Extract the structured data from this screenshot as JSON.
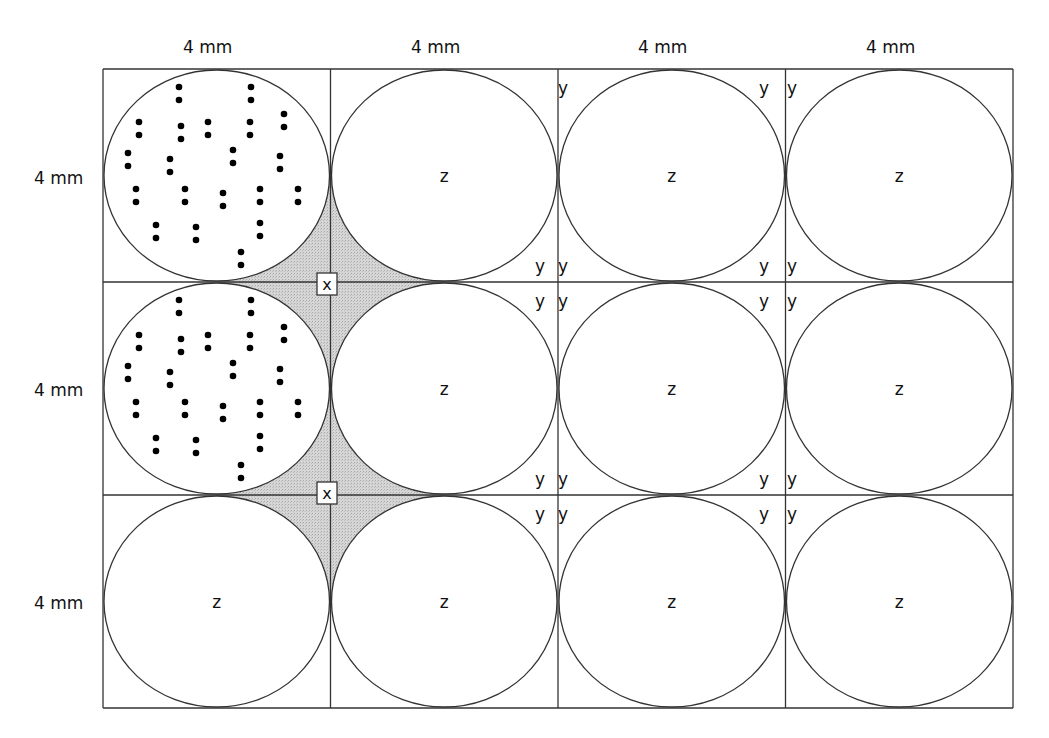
{
  "diagram": {
    "grid": {
      "columns": 4,
      "rows": 3,
      "left": 103,
      "top": 69,
      "cell_width": 227.5,
      "cell_height": 213,
      "line_color": "#333333",
      "fill_color": "#d4d4d4"
    },
    "column_labels": [
      "4 mm",
      "4 mm",
      "4 mm",
      "4 mm"
    ],
    "row_labels": [
      "4 mm",
      "4 mm",
      "4 mm"
    ],
    "cells": [
      {
        "row": 0,
        "col": 0,
        "content": "dots",
        "label": ""
      },
      {
        "row": 0,
        "col": 1,
        "content": "label",
        "label": "z"
      },
      {
        "row": 0,
        "col": 2,
        "content": "label",
        "label": "z"
      },
      {
        "row": 0,
        "col": 3,
        "content": "label",
        "label": "z"
      },
      {
        "row": 1,
        "col": 0,
        "content": "dots",
        "label": ""
      },
      {
        "row": 1,
        "col": 1,
        "content": "label",
        "label": "z"
      },
      {
        "row": 1,
        "col": 2,
        "content": "label",
        "label": "z"
      },
      {
        "row": 1,
        "col": 3,
        "content": "label",
        "label": "z"
      },
      {
        "row": 2,
        "col": 0,
        "content": "label",
        "label": "z"
      },
      {
        "row": 2,
        "col": 1,
        "content": "label",
        "label": "z"
      },
      {
        "row": 2,
        "col": 2,
        "content": "label",
        "label": "z"
      },
      {
        "row": 2,
        "col": 3,
        "content": "label",
        "label": "z"
      }
    ],
    "dot_pairs": [
      [
        76,
        18
      ],
      [
        148,
        18
      ],
      [
        36,
        53
      ],
      [
        78,
        57
      ],
      [
        105,
        53
      ],
      [
        147,
        53
      ],
      [
        181,
        45
      ],
      [
        25,
        84
      ],
      [
        67,
        90
      ],
      [
        130,
        81
      ],
      [
        177,
        87
      ],
      [
        33,
        120
      ],
      [
        82,
        120
      ],
      [
        120,
        124
      ],
      [
        157,
        120
      ],
      [
        195,
        120
      ],
      [
        53,
        156
      ],
      [
        93,
        158
      ],
      [
        157,
        154
      ],
      [
        138,
        183
      ]
    ],
    "interstitial_label": "x",
    "interstitial_boxes": [
      {
        "cx": 327,
        "cy": 284
      },
      {
        "cx": 327,
        "cy": 493
      }
    ],
    "corner_label": "y",
    "corner_labels": [
      {
        "x": 540,
        "y": 272
      },
      {
        "x": 563,
        "y": 94
      },
      {
        "x": 764,
        "y": 94
      },
      {
        "x": 563,
        "y": 272
      },
      {
        "x": 764,
        "y": 272
      },
      {
        "x": 792,
        "y": 94
      },
      {
        "x": 792,
        "y": 272
      },
      {
        "x": 540,
        "y": 307
      },
      {
        "x": 540,
        "y": 485
      },
      {
        "x": 563,
        "y": 307
      },
      {
        "x": 764,
        "y": 307
      },
      {
        "x": 563,
        "y": 485
      },
      {
        "x": 764,
        "y": 485
      },
      {
        "x": 792,
        "y": 307
      },
      {
        "x": 792,
        "y": 485
      },
      {
        "x": 540,
        "y": 520
      },
      {
        "x": 563,
        "y": 520
      },
      {
        "x": 764,
        "y": 520
      },
      {
        "x": 792,
        "y": 520
      }
    ]
  }
}
